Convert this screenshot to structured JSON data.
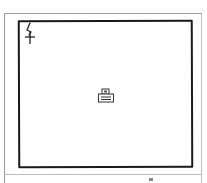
{
  "window": {
    "frame_color": "#9a9a9a",
    "canvas_border_color": "#1a1a1a"
  },
  "canvas": {
    "label": "Drawing canvas",
    "corner_icon": "pen-stroke-icon",
    "center_icon": "printer-icon"
  },
  "status_bar": {
    "mark": "status-indicator"
  }
}
